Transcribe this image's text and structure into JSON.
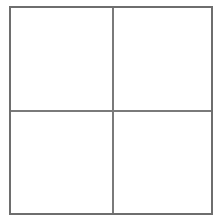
{
  "grid": {
    "rows": 2,
    "columns": 2,
    "cells": [
      {
        "row": 0,
        "col": 0,
        "content": ""
      },
      {
        "row": 0,
        "col": 1,
        "content": ""
      },
      {
        "row": 1,
        "col": 0,
        "content": ""
      },
      {
        "row": 1,
        "col": 1,
        "content": ""
      }
    ],
    "border_color": "#6e6e6e",
    "line_color": "#7a7a7a",
    "background": "#ffffff"
  }
}
